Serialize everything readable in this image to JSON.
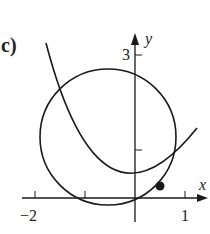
{
  "figure": {
    "panel_label": "c)",
    "x_axis_label": "x",
    "y_axis_label": "y",
    "x_tick_labels": [
      "−2",
      "1"
    ],
    "y_tick_labels": [
      "3"
    ],
    "x_ticks": [
      -2,
      -1,
      1
    ],
    "y_ticks": [
      1,
      3
    ],
    "curves": [
      {
        "name": "circle",
        "description": "circle centered left of y-axis, tangent-ish to parabola"
      },
      {
        "name": "parabola",
        "description": "upward-opening parabola with vertex near origin"
      }
    ],
    "marked_point": {
      "description": "solid dot where circle and parabola touch",
      "approx_x": 0.5,
      "approx_y": 0.25
    },
    "colors": {
      "stroke": "#1a1a1a",
      "background": "#ffffff"
    }
  }
}
